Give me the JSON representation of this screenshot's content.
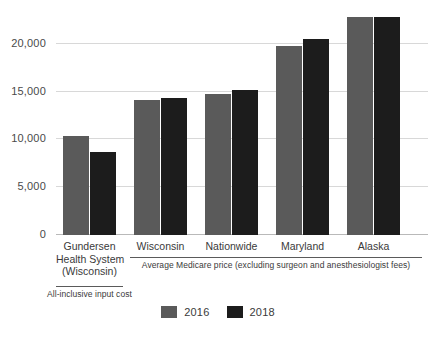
{
  "chart_data": {
    "type": "bar",
    "title": "",
    "subtitle": "",
    "xlabel": "",
    "ylabel": "",
    "grid": true,
    "legend_position": "bottom-center",
    "categories": [
      "Gundersen Health System (Wisconsin)",
      "Wisconsin",
      "Nationwide",
      "Maryland",
      "Alaska"
    ],
    "series": [
      {
        "name": "2016",
        "color": "#5a5a5a",
        "values": [
          10200,
          13900,
          14500,
          19400,
          22400
        ]
      },
      {
        "name": "2018",
        "color": "#1c1c1c",
        "values": [
          8500,
          14100,
          14900,
          20100,
          22400
        ]
      }
    ],
    "ylim": [
      0,
      22800
    ],
    "yticks": [
      0,
      5000,
      10000,
      15000,
      20000
    ],
    "ytick_labels": [
      "0",
      "5,000",
      "10,000",
      "15,000",
      "20,000"
    ]
  },
  "axis": {
    "y_labels": [
      "20,000",
      "15,000",
      "10,000",
      "5,000",
      "0"
    ]
  },
  "categories": [
    {
      "line1": "Gundersen",
      "line2": "Health System",
      "line3": "(Wisconsin)"
    },
    {
      "line1": "Wisconsin",
      "line2": "",
      "line3": ""
    },
    {
      "line1": "Nationwide",
      "line2": "",
      "line3": ""
    },
    {
      "line1": "Maryland",
      "line2": "",
      "line3": ""
    },
    {
      "line1": "Alaska",
      "line2": "",
      "line3": ""
    }
  ],
  "annotations": {
    "group_caption": "Average Medicare price (excluding surgeon and anesthesiologist fees)",
    "single_caption": "All-inclusive input cost"
  },
  "legend": {
    "items": [
      {
        "label": "2016",
        "color": "#5a5a5a"
      },
      {
        "label": "2018",
        "color": "#1c1c1c"
      }
    ]
  },
  "colors": {
    "series_2016": "#5a5a5a",
    "series_2018": "#1c1c1c",
    "gridline": "#d8d8d8",
    "baseline": "#b9b9b9",
    "text": "#3a3a3a",
    "background": "#ffffff"
  }
}
